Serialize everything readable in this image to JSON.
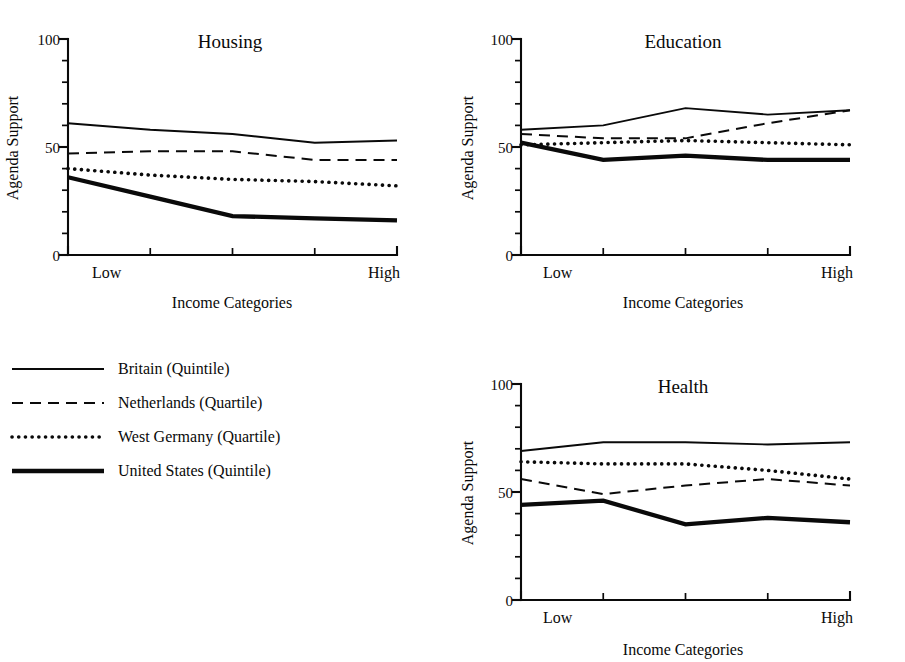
{
  "figure": {
    "background_color": "#ffffff",
    "ink_color": "#0a0a0a"
  },
  "axis_labels": {
    "y": "Agenda Support",
    "x": "Income Categories",
    "x_low": "Low",
    "x_high": "High"
  },
  "y_ticks": {
    "labels": [
      "0",
      "50",
      "100"
    ],
    "values": [
      0,
      50,
      100
    ],
    "minor_step": 10
  },
  "legend": {
    "items": [
      {
        "label": "Britain (Quintile)",
        "style": "solid-thin",
        "key": "britain"
      },
      {
        "label": "Netherlands (Quartile)",
        "style": "dashed",
        "key": "netherlands"
      },
      {
        "label": "West Germany (Quartile)",
        "style": "dotted",
        "key": "west_germany"
      },
      {
        "label": "United States (Quintile)",
        "style": "solid-thick",
        "key": "united_states"
      }
    ]
  },
  "chart_data": [
    {
      "type": "line",
      "title": "Housing",
      "xlabel": "Income Categories",
      "ylabel": "Agenda Support",
      "ylim": [
        0,
        100
      ],
      "yticks": [
        0,
        50,
        100
      ],
      "grid": false,
      "legend_position": "external-left",
      "categories": [
        "Low",
        "2",
        "3",
        "4",
        "High"
      ],
      "x_tick_labels": [
        "Low",
        "",
        "",
        "",
        "High"
      ],
      "series": [
        {
          "name": "Britain (Quintile)",
          "key": "britain",
          "style": "solid-thin",
          "values": [
            61,
            58,
            56,
            52,
            53
          ]
        },
        {
          "name": "Netherlands (Quartile)",
          "key": "netherlands",
          "style": "dashed",
          "values": [
            47,
            48,
            48,
            44,
            44
          ]
        },
        {
          "name": "West Germany (Quartile)",
          "key": "west_germany",
          "style": "dotted",
          "values": [
            40,
            37,
            35,
            34,
            32
          ]
        },
        {
          "name": "United States (Quintile)",
          "key": "united_states",
          "style": "solid-thick",
          "values": [
            36,
            27,
            18,
            17,
            16
          ]
        }
      ]
    },
    {
      "type": "line",
      "title": "Education",
      "xlabel": "Income Categories",
      "ylabel": "Agenda Support",
      "ylim": [
        0,
        100
      ],
      "yticks": [
        0,
        50,
        100
      ],
      "grid": false,
      "legend_position": "external-left",
      "categories": [
        "Low",
        "2",
        "3",
        "4",
        "High"
      ],
      "x_tick_labels": [
        "Low",
        "",
        "",
        "",
        "High"
      ],
      "series": [
        {
          "name": "Britain (Quintile)",
          "key": "britain",
          "style": "solid-thin",
          "values": [
            58,
            60,
            68,
            65,
            67
          ]
        },
        {
          "name": "Netherlands (Quartile)",
          "key": "netherlands",
          "style": "dashed",
          "values": [
            56,
            54,
            54,
            61,
            67
          ]
        },
        {
          "name": "West Germany (Quartile)",
          "key": "west_germany",
          "style": "dotted",
          "values": [
            51,
            52,
            53,
            52,
            51
          ]
        },
        {
          "name": "United States (Quintile)",
          "key": "united_states",
          "style": "solid-thick",
          "values": [
            52,
            44,
            46,
            44,
            44
          ]
        }
      ]
    },
    {
      "type": "line",
      "title": "Health",
      "xlabel": "Income Categories",
      "ylabel": "Agenda Support",
      "ylim": [
        0,
        100
      ],
      "yticks": [
        0,
        50,
        100
      ],
      "grid": false,
      "legend_position": "external-left",
      "categories": [
        "Low",
        "2",
        "3",
        "4",
        "High"
      ],
      "x_tick_labels": [
        "Low",
        "",
        "",
        "",
        "High"
      ],
      "series": [
        {
          "name": "Britain (Quintile)",
          "key": "britain",
          "style": "solid-thin",
          "values": [
            69,
            73,
            73,
            72,
            73
          ]
        },
        {
          "name": "Netherlands (Quartile)",
          "key": "netherlands",
          "style": "dashed",
          "values": [
            56,
            49,
            53,
            56,
            53
          ]
        },
        {
          "name": "West Germany (Quartile)",
          "key": "west_germany",
          "style": "dotted",
          "values": [
            64,
            63,
            63,
            60,
            56
          ]
        },
        {
          "name": "United States (Quintile)",
          "key": "united_states",
          "style": "solid-thick",
          "values": [
            44,
            46,
            35,
            38,
            36
          ]
        }
      ]
    }
  ]
}
